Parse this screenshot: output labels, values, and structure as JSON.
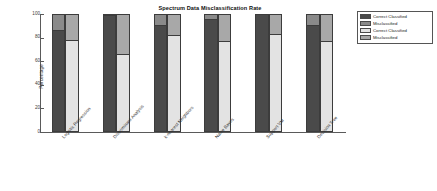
{
  "chart_data": {
    "type": "bar",
    "title": "Spectrum Data Misclassification Rate",
    "xlabel": "",
    "ylabel": "Percentage",
    "ylim": [
      0,
      100
    ],
    "yticks": [
      0,
      20,
      40,
      60,
      80,
      100
    ],
    "grid": false,
    "stacked": true,
    "legend_position": "upper right outside",
    "categories": [
      "Logistic Regression",
      "Discriminant Analysis",
      "k-nearest Neighbors",
      "Naive Bayes",
      "Support VM",
      "Decision Tree"
    ],
    "series": [
      {
        "name": "Correct Classified",
        "color": "#4a4a4a",
        "values": [
          86,
          98,
          90,
          95,
          100,
          90
        ]
      },
      {
        "name": "Misclassified",
        "color": "#8a8a8a",
        "values": [
          14,
          2,
          10,
          5,
          0,
          10
        ]
      },
      {
        "name": "Correct Classified",
        "color": "#e3e3e3",
        "values": [
          77,
          65,
          81,
          76,
          82,
          76
        ]
      },
      {
        "name": "Misclassified",
        "color": "#a8a8a8",
        "values": [
          23,
          35,
          19,
          24,
          18,
          24
        ]
      }
    ]
  },
  "legend": {
    "entries": [
      {
        "label": "Correct Classified",
        "color": "#4a4a4a"
      },
      {
        "label": "Misclassified",
        "color": "#8a8a8a"
      },
      {
        "label": "Correct Classified",
        "color": "#e3e3e3"
      },
      {
        "label": "Misclassified",
        "color": "#a8a8a8"
      }
    ]
  }
}
